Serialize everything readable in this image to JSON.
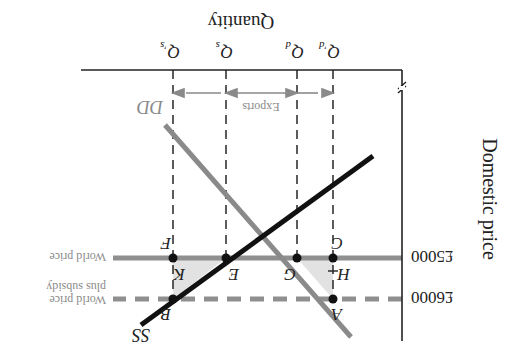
{
  "diagram": {
    "orientation": "rotated-180",
    "axes": {
      "y_label": "Domestic price",
      "x_label": "Quantity",
      "y_ticks": [
        {
          "label": "£5000",
          "level": "world_price"
        },
        {
          "label": "£6000",
          "level": "world_price_plus_subsidy"
        }
      ],
      "axis_break": true
    },
    "quantity_ticks": {
      "q_d_prime": "Q'd",
      "q_d": "Qd",
      "q_s": "Qs",
      "q_s_prime": "Q's"
    },
    "curves": {
      "supply": "SS",
      "demand": "DD"
    },
    "price_lines": {
      "world_price": "World price",
      "world_price_subsidy_line1": "World price",
      "world_price_subsidy_line2": "plus subsidy"
    },
    "points": [
      "A",
      "B",
      "C",
      "E",
      "F",
      "G",
      "H",
      "K"
    ],
    "annotations": {
      "exports": "Exports"
    },
    "colors": {
      "supply": "#111111",
      "demand": "#8a8a8a",
      "price_line": "#8f8f8f",
      "triangle_fill": "#e2e2e2",
      "axis": "#222222",
      "label_gray": "#8a8a8a"
    }
  }
}
